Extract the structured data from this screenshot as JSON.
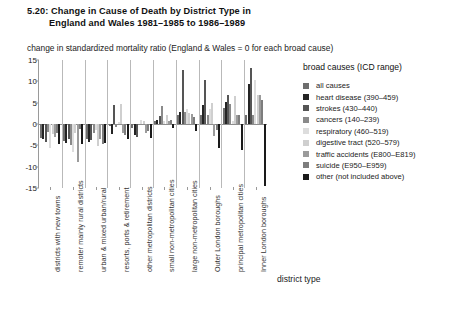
{
  "figure": {
    "number": "5.20",
    "title_line1": "5.20: Change in Cause of Death by District Type in",
    "title_line2": "England and Wales 1981–1985 to 1986–1989",
    "subtitle": "change in standardized mortality ratio (England & Wales = 0 for each broad cause)"
  },
  "legend": {
    "title": "broad causes (ICD range)"
  },
  "chart_data": {
    "type": "bar",
    "title": "5.20: Change in Cause of Death by District Type in England and Wales 1981–1985 to 1986–1989",
    "subtitle": "change in standardized mortality ratio (England & Wales = 0 for each broad cause)",
    "xlabel": "district type",
    "ylabel": "",
    "ylim": [
      -15,
      15
    ],
    "yticks": [
      15,
      10,
      5,
      0,
      -5,
      -10,
      -15
    ],
    "ytick_labels": [
      "15",
      "10",
      "5",
      "0",
      "-5",
      "-10",
      "-15"
    ],
    "grid": false,
    "legend_position": "right",
    "legend_title": "broad causes (ICD range)",
    "categories": [
      "districts with new towns",
      "remoter mainly rural districts",
      "urban & mixed urban/rural",
      "resorts, ports & retirement",
      "other metropolitan districts",
      "small non-metropolitan cities",
      "large non-metropolitan cities",
      "Outer London boroughs",
      "principal metropolitan cities",
      "Inner London boroughs"
    ],
    "series": [
      {
        "name": "all causes",
        "icd": "",
        "label": "all causes",
        "color": "#6e6e6e",
        "values": [
          -3.2,
          -4.0,
          -3.6,
          -0.4,
          -1.0,
          0.6,
          2.0,
          2.2,
          3.8,
          2.1
        ]
      },
      {
        "name": "heart disease",
        "icd": "390–459",
        "label": "heart disease (390–459)",
        "color": "#242424",
        "values": [
          -3.6,
          -4.4,
          -4.2,
          -2.4,
          -2.6,
          0.9,
          2.9,
          4.4,
          5.2,
          9.3
        ]
      },
      {
        "name": "strokes",
        "icd": "430–440",
        "label": "strokes (430–440)",
        "color": "#555555",
        "values": [
          -4.2,
          -3.4,
          -3.8,
          4.4,
          -3.0,
          1.9,
          12.6,
          10.4,
          6.8,
          13.2
        ]
      },
      {
        "name": "cancers",
        "icd": "140–239",
        "label": "cancers (140–239)",
        "color": "#8a8a8a",
        "values": [
          -1.8,
          -5.0,
          -2.0,
          -0.6,
          -0.2,
          4.2,
          2.8,
          2.2,
          4.8,
          2.2
        ]
      },
      {
        "name": "respiratory",
        "icd": "460–519",
        "label": "respiratory (460–519)",
        "color": "#dddddd",
        "values": [
          -5.6,
          -6.6,
          -1.4,
          0.4,
          1.0,
          0.8,
          3.4,
          3.6,
          0.6,
          10.4
        ]
      },
      {
        "name": "digestive tract",
        "icd": "520–579",
        "label": "digestive tract (520–579)",
        "color": "#cfcfcf",
        "values": [
          -2.4,
          -2.2,
          -5.2,
          4.8,
          0.6,
          2.2,
          2.6,
          5.0,
          6.6,
          6.8
        ]
      },
      {
        "name": "traffic accidents",
        "icd": "E800–E819",
        "label": "traffic accidents (E800–E819)",
        "color": "#9b9b9b",
        "values": [
          -3.0,
          -8.8,
          -3.4,
          -2.2,
          -2.0,
          0.8,
          2.4,
          -2.8,
          2.2,
          6.8
        ]
      },
      {
        "name": "suicide",
        "icd": "E950–E959",
        "label": "suicide (E950–E959)",
        "color": "#7d7d7d",
        "values": [
          -2.0,
          -1.2,
          -4.6,
          -2.6,
          -1.6,
          1.0,
          1.6,
          -1.4,
          2.0,
          5.6
        ]
      },
      {
        "name": "other (not included above)",
        "icd": "",
        "label": "other (not included above)",
        "color": "#1a1a1a",
        "values": [
          -4.6,
          -4.8,
          -4.4,
          -3.4,
          -3.2,
          -1.0,
          -1.6,
          -5.6,
          -6.2,
          -14.6
        ]
      }
    ]
  }
}
